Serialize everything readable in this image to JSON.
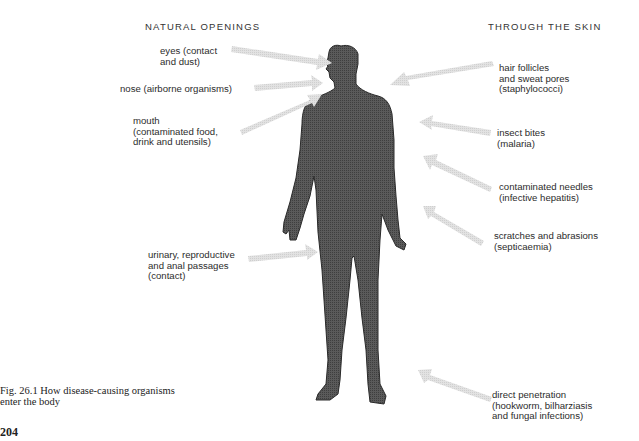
{
  "headings": {
    "left": "NATURAL OPENINGS",
    "right": "THROUGH THE SKIN"
  },
  "natural_openings": [
    {
      "label": "eyes (contact\nand dust)"
    },
    {
      "label": "nose (airborne organisms)"
    },
    {
      "label": "mouth\n(contaminated food,\ndrink and utensils)"
    },
    {
      "label": "urinary, reproductive\nand anal passages\n(contact)"
    }
  ],
  "through_the_skin": [
    {
      "label": "hair follicles\nand sweat pores\n(staphylococci)"
    },
    {
      "label": "insect bites\n(malaria)"
    },
    {
      "label": "contaminated needles\n(infective hepatitis)"
    },
    {
      "label": "scratches and abrasions\n(septicaemia)"
    },
    {
      "label": "direct penetration\n(hookworm, bilharziasis\nand fungal infections)"
    }
  ],
  "figure": {
    "caption": "Fig. 26.1   How disease-causing organisms\nenter the body",
    "page_number": "204"
  },
  "colors": {
    "body_fill": "#555555",
    "arrow_fill": "#dcdcdc",
    "text": "#2c2c2c"
  }
}
